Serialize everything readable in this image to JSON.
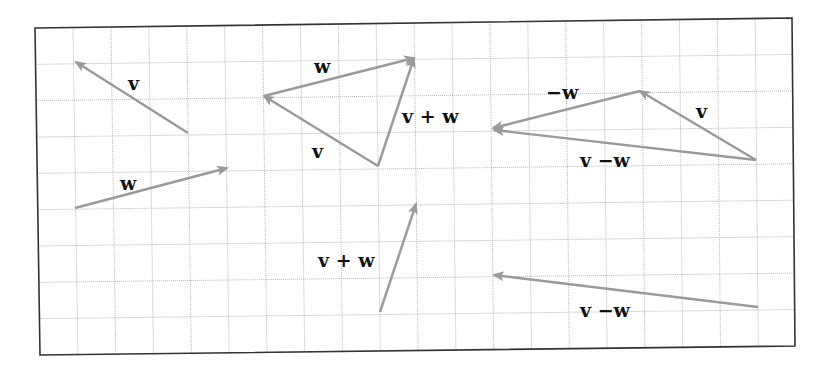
{
  "diagram": {
    "colors": {
      "vector": "#9a9a9a",
      "grid": "#b8b8b8",
      "frame": "#333333",
      "label": "#111111"
    },
    "grid": {
      "cols": 20,
      "rows": 9
    },
    "vectors": [
      {
        "id": "v-left",
        "from": [
          188,
          133
        ],
        "to": [
          76,
          62
        ]
      },
      {
        "id": "w-left",
        "from": [
          75,
          208
        ],
        "to": [
          227,
          168
        ]
      },
      {
        "id": "v-triangle",
        "from": [
          378,
          166
        ],
        "to": [
          264,
          96
        ]
      },
      {
        "id": "w-triangle",
        "from": [
          264,
          96
        ],
        "to": [
          414,
          58
        ]
      },
      {
        "id": "vw-triangle",
        "from": [
          378,
          166
        ],
        "to": [
          414,
          58
        ]
      },
      {
        "id": "v-right",
        "from": [
          756,
          160
        ],
        "to": [
          640,
          91
        ]
      },
      {
        "id": "negw-right",
        "from": [
          640,
          91
        ],
        "to": [
          493,
          128
        ]
      },
      {
        "id": "vmw-right",
        "from": [
          756,
          160
        ],
        "to": [
          494,
          130
        ]
      },
      {
        "id": "vw-lower",
        "from": [
          380,
          312
        ],
        "to": [
          416,
          204
        ]
      },
      {
        "id": "vmw-lower",
        "from": [
          758,
          307
        ],
        "to": [
          494,
          275
        ]
      }
    ],
    "labels": {
      "v_left": "v",
      "w_left": "w",
      "w_triangle": "w",
      "v_triangle": "v",
      "vw_triangle": "v + w",
      "negw_right": "−w",
      "v_right": "v",
      "vmw_right": "v −w",
      "vw_lower": "v + w",
      "vmw_lower": "v −w"
    }
  }
}
